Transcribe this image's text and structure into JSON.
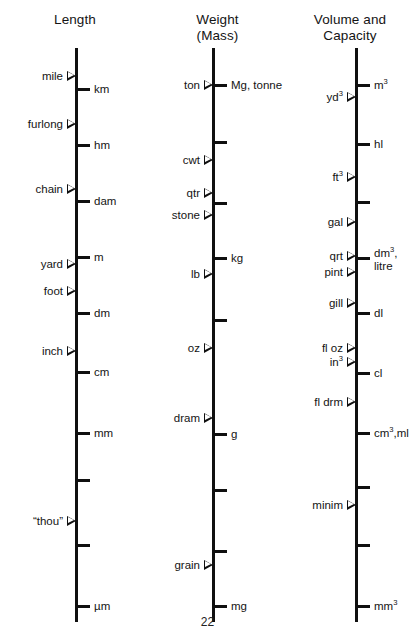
{
  "page": {
    "number": "22",
    "figure_type": "comparative logarithmic scale chart of units of measurement"
  },
  "columns": [
    {
      "id": "length",
      "title": "Length",
      "imperial_units": [
        "mile",
        "furlong",
        "chain",
        "yard",
        "foot",
        "inch",
        "“thou”"
      ],
      "metric_units": [
        "km",
        "hm",
        "dam",
        "m",
        "dm",
        "cm",
        "mm",
        "µm"
      ]
    },
    {
      "id": "weight",
      "title": "Weight\n(Mass)",
      "imperial_units": [
        "ton",
        "cwt",
        "qtr",
        "stone",
        "lb",
        "oz",
        "dram",
        "grain"
      ],
      "metric_units": [
        "Mg, tonne",
        "kg",
        "g",
        "mg"
      ]
    },
    {
      "id": "volume",
      "title": "Volume and\nCapacity",
      "imperial_units": [
        "yd³",
        "ft³",
        "gal",
        "qrt",
        "pint",
        "gill",
        "fl oz",
        "in³",
        "fl drm",
        "minim"
      ],
      "metric_units": [
        "m³",
        "hl",
        "dm³,\nlitre",
        "dl",
        "cl",
        "cm³,ml",
        "mm³"
      ]
    }
  ],
  "chart_data": {
    "type": "scatter",
    "xlabel": "",
    "ylabel": "",
    "grid": false,
    "legend": "none",
    "axes": [
      {
        "name": "Length",
        "axis_x": 75,
        "axis_top": 48,
        "axis_bottom": 622,
        "imperial_side": "left",
        "metric_side": "right",
        "imperial": [
          {
            "label": "mile",
            "y": 76
          },
          {
            "label": "furlong",
            "y": 124
          },
          {
            "label": "chain",
            "y": 189
          },
          {
            "label": "yard",
            "y": 264
          },
          {
            "label": "foot",
            "y": 291
          },
          {
            "label": "inch",
            "y": 351
          },
          {
            "label": "“thou”",
            "y": 521
          }
        ],
        "metric": [
          {
            "label": "km",
            "y": 89
          },
          {
            "label": "hm",
            "y": 145
          },
          {
            "label": "dam",
            "y": 201
          },
          {
            "label": "m",
            "y": 257
          },
          {
            "label": "dm",
            "y": 313
          },
          {
            "label": "cm",
            "y": 372
          },
          {
            "label": "mm",
            "y": 433
          },
          {
            "label": "",
            "y": 480
          },
          {
            "label": "",
            "y": 545
          },
          {
            "label": "µm",
            "y": 606
          }
        ]
      },
      {
        "name": "Weight (Mass)",
        "axis_x": 212,
        "axis_top": 48,
        "axis_bottom": 622,
        "imperial_side": "left",
        "metric_side": "right",
        "imperial": [
          {
            "label": "ton",
            "y": 85
          },
          {
            "label": "cwt",
            "y": 160
          },
          {
            "label": "qtr",
            "y": 193
          },
          {
            "label": "stone",
            "y": 215
          },
          {
            "label": "lb",
            "y": 274
          },
          {
            "label": "oz",
            "y": 348
          },
          {
            "label": "dram",
            "y": 418
          },
          {
            "label": "grain",
            "y": 565
          }
        ],
        "metric": [
          {
            "label": "Mg, tonne",
            "y": 85
          },
          {
            "label": "",
            "y": 142
          },
          {
            "label": "",
            "y": 203
          },
          {
            "label": "kg",
            "y": 258
          },
          {
            "label": "",
            "y": 320
          },
          {
            "label": "g",
            "y": 434
          },
          {
            "label": "",
            "y": 490
          },
          {
            "label": "",
            "y": 551
          },
          {
            "label": "mg",
            "y": 606
          }
        ]
      },
      {
        "name": "Volume and Capacity",
        "axis_x": 355,
        "axis_top": 48,
        "axis_bottom": 622,
        "imperial_side": "left",
        "metric_side": "right",
        "imperial": [
          {
            "label": "yd³",
            "y": 97
          },
          {
            "label": "ft³",
            "y": 177
          },
          {
            "label": "gal",
            "y": 222
          },
          {
            "label": "qrt",
            "y": 256
          },
          {
            "label": "pint",
            "y": 272
          },
          {
            "label": "gill",
            "y": 303
          },
          {
            "label": "fl oz",
            "y": 348
          },
          {
            "label": "in³",
            "y": 362
          },
          {
            "label": "fl drm",
            "y": 402
          },
          {
            "label": "minim",
            "y": 505
          }
        ],
        "metric": [
          {
            "label": "m³",
            "y": 85
          },
          {
            "label": "hl",
            "y": 144
          },
          {
            "label": "",
            "y": 202
          },
          {
            "label": "dm³,\nlitre",
            "y": 258
          },
          {
            "label": "dl",
            "y": 313
          },
          {
            "label": "cl",
            "y": 373
          },
          {
            "label": "cm³,ml",
            "y": 433
          },
          {
            "label": "",
            "y": 487
          },
          {
            "label": "",
            "y": 545
          },
          {
            "label": "mm³",
            "y": 606
          }
        ]
      }
    ]
  }
}
